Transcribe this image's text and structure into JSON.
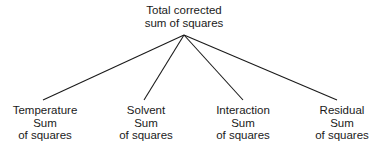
{
  "diagram": {
    "type": "tree",
    "root": {
      "id": "total",
      "lines": [
        "Total corrected",
        "sum of squares"
      ],
      "x": 184,
      "y": 4,
      "apex": {
        "x": 184,
        "y": 35
      }
    },
    "children": [
      {
        "id": "temperature",
        "lines": [
          "Temperature",
          "Sum",
          "of squares"
        ],
        "x": 45,
        "y": 104,
        "edge_end": {
          "x": 43,
          "y": 100
        }
      },
      {
        "id": "solvent",
        "lines": [
          "Solvent",
          "Sum",
          "of squares"
        ],
        "x": 146,
        "y": 104,
        "edge_end": {
          "x": 144,
          "y": 100
        }
      },
      {
        "id": "interaction",
        "lines": [
          "Interaction",
          "Sum",
          "of squares"
        ],
        "x": 243,
        "y": 104,
        "edge_end": {
          "x": 243,
          "y": 100
        }
      },
      {
        "id": "residual",
        "lines": [
          "Residual",
          "Sum",
          "of squares"
        ],
        "x": 342,
        "y": 104,
        "edge_end": {
          "x": 337,
          "y": 100
        }
      }
    ],
    "line_color": "#1a1a1a"
  }
}
